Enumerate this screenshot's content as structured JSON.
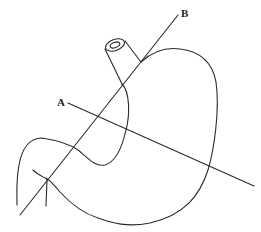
{
  "diagram": {
    "labels": {
      "a": "A",
      "b": "B"
    },
    "colors": {
      "stroke": "#2a2a2a",
      "background": "#ffffff"
    }
  }
}
